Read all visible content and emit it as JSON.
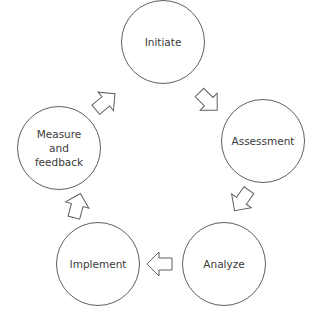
{
  "diagram": {
    "type": "cycle",
    "stroke_color": "#606060",
    "text_color": "#3a3a3a",
    "nodes": [
      {
        "id": "initiate",
        "label": "Initiate"
      },
      {
        "id": "assessment",
        "label": "Assessment"
      },
      {
        "id": "analyze",
        "label": "Analyze"
      },
      {
        "id": "implement",
        "label": "Implement"
      },
      {
        "id": "measure",
        "label": "Measure\nand\nfeedback"
      }
    ],
    "edges": [
      {
        "from": "initiate",
        "to": "assessment"
      },
      {
        "from": "assessment",
        "to": "analyze"
      },
      {
        "from": "analyze",
        "to": "implement"
      },
      {
        "from": "implement",
        "to": "measure"
      },
      {
        "from": "measure",
        "to": "initiate"
      }
    ]
  }
}
